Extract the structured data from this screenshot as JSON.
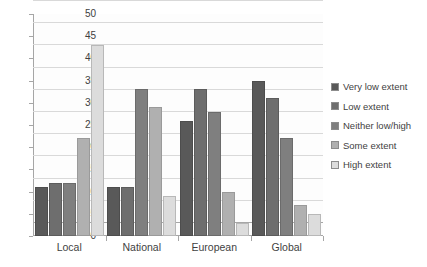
{
  "chart_data": {
    "type": "bar",
    "title": "",
    "subtitle": "",
    "xlabel": "",
    "ylabel": "",
    "categories": [
      "Local",
      "National",
      "European",
      "Global"
    ],
    "series": [
      {
        "name": "Very low extent",
        "color": "#595959",
        "values": [
          11,
          11,
          26,
          35
        ]
      },
      {
        "name": "Low extent",
        "color": "#6e6e6e",
        "values": [
          12,
          11,
          33,
          31
        ]
      },
      {
        "name": "Neither low/high",
        "color": "#7f7f7f",
        "values": [
          12,
          33,
          28,
          22
        ]
      },
      {
        "name": "Some extent",
        "color": "#b0b0b0",
        "values": [
          22,
          29,
          10,
          7
        ]
      },
      {
        "name": "High extent",
        "color": "#dcdcdc",
        "values": [
          43,
          9,
          3,
          5
        ]
      }
    ],
    "ylim": [
      0,
      50
    ],
    "ystep": 5,
    "yticks": [
      0,
      5,
      10,
      15,
      20,
      25,
      30,
      35,
      40,
      45,
      50
    ],
    "grid": true,
    "legend_position": "right",
    "annotations": []
  }
}
